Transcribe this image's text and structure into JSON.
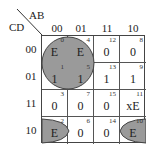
{
  "title_axis": {
    "column_variables": "AB",
    "row_variables": "CD"
  },
  "columns": [
    "00",
    "01",
    "11",
    "10"
  ],
  "rows": [
    "00",
    "01",
    "11",
    "10"
  ],
  "cells": [
    [
      {
        "minterm": "0",
        "value": "E"
      },
      {
        "minterm": "4",
        "value": "E"
      },
      {
        "minterm": "12",
        "value": "0"
      },
      {
        "minterm": "8",
        "value": "0"
      }
    ],
    [
      {
        "minterm": "1",
        "value": "1"
      },
      {
        "minterm": "5",
        "value": "1"
      },
      {
        "minterm": "13",
        "value": "1"
      },
      {
        "minterm": "9",
        "value": "1"
      }
    ],
    [
      {
        "minterm": "3",
        "value": "0"
      },
      {
        "minterm": "7",
        "value": "0"
      },
      {
        "minterm": "15",
        "value": "0"
      },
      {
        "minterm": "11",
        "value": "xE"
      }
    ],
    [
      {
        "minterm": "2",
        "value": "E"
      },
      {
        "minterm": "6",
        "value": "0"
      },
      {
        "minterm": "14",
        "value": "0"
      },
      {
        "minterm": "10",
        "value": "E"
      }
    ]
  ],
  "groupings": [
    {
      "name": "quad-group",
      "cells": [
        "0",
        "4",
        "1",
        "5"
      ],
      "shape": "circle"
    },
    {
      "name": "wrap-pair-group",
      "cells": [
        "2",
        "10"
      ],
      "shape": "half-ellipses"
    }
  ],
  "colors": {
    "group_fill": "#9a9a9a",
    "group_stroke": "#444444",
    "grid_line": "#555555",
    "text": "#222222"
  }
}
